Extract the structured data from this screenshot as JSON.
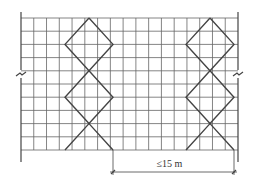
{
  "diagram": {
    "colors": {
      "line": "#444444",
      "grid": "#666666",
      "background": "#ffffff"
    },
    "grid": {
      "x_start": 21,
      "x_end": 238,
      "y_start": 18,
      "y_end": 150,
      "columns": 17,
      "rows": 10
    },
    "braces": [
      {
        "name": "left-brace",
        "cx": 89,
        "top": 18,
        "bottom": 150,
        "half_width": 24
      },
      {
        "name": "right-brace",
        "cx": 210,
        "top": 18,
        "bottom": 150,
        "half_width": 24
      }
    ],
    "dimension": {
      "label": "≤15 m",
      "x1": 113,
      "x2": 234,
      "y": 172
    }
  }
}
